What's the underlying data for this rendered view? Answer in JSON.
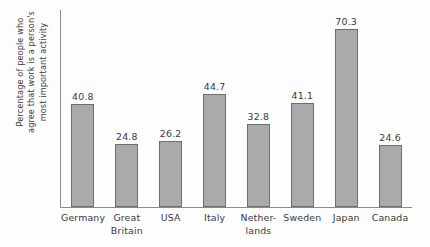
{
  "chart_data": {
    "type": "bar",
    "title": "",
    "subtitle": "",
    "xlabel": "",
    "ylabel": "Percentage of people who agree that work is a person's most important activity",
    "ylabel_lines": [
      "Percentage of people who",
      "agree that work is a person's",
      "most important activity"
    ],
    "categories": [
      "Germany",
      "Great Britain",
      "USA",
      "Italy",
      "Netherlands",
      "Sweden",
      "Japan",
      "Canada"
    ],
    "category_lines": [
      [
        "Germany"
      ],
      [
        "Great",
        "Britain"
      ],
      [
        "USA"
      ],
      [
        "Italy"
      ],
      [
        "Nether-",
        "lands"
      ],
      [
        "Sweden"
      ],
      [
        "Japan"
      ],
      [
        "Canada"
      ]
    ],
    "values": [
      40.8,
      24.8,
      26.2,
      44.7,
      32.8,
      41.1,
      70.3,
      24.6
    ],
    "value_labels": [
      "40.8",
      "24.8",
      "26.2",
      "44.7",
      "32.8",
      "41.1",
      "70.3",
      "24.6"
    ],
    "ylim": [
      0,
      78
    ],
    "grid": false,
    "y_ticks": [],
    "legend": [],
    "legend_position": "none",
    "annotations": [],
    "colors": {
      "bar_fill": "#aaaaaa",
      "bar_stroke": "#6e6e6e",
      "axis": "#8b8b8b",
      "text": "#3a3a3a",
      "background": "#fdfdfd"
    }
  }
}
